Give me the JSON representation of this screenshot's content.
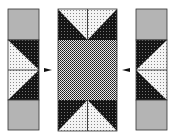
{
  "diagram": {
    "type": "quilt-block-assembly",
    "colors": {
      "gray": "#b4b4b4",
      "dark": "#1a1a1a",
      "light": "#f2f2f2",
      "outline": "#333333",
      "arrow": "#111111"
    },
    "left_strip": {
      "units": [
        "gray-square",
        "flying-geese-pair-pointing-right",
        "gray-square"
      ]
    },
    "center_strip": {
      "units": [
        "flying-geese-pointing-down",
        "grid-fabric-rectangle",
        "flying-geese-pointing-up"
      ]
    },
    "right_strip": {
      "units": [
        "gray-square",
        "flying-geese-pair-pointing-left",
        "gray-square"
      ]
    },
    "arrows": [
      {
        "id": "left-arrow",
        "direction": "right"
      },
      {
        "id": "right-arrow",
        "direction": "left"
      }
    ]
  }
}
